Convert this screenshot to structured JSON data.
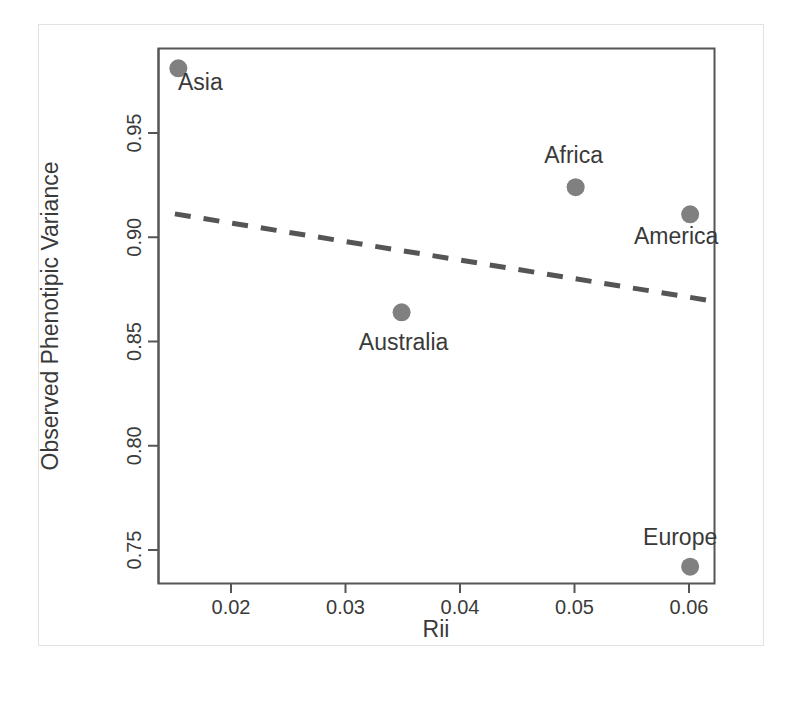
{
  "chart_data": {
    "type": "scatter",
    "title": "",
    "xlabel": "Rii",
    "ylabel": "Observed Phenotipic Variance",
    "xlim": [
      0.0135,
      0.0622
    ],
    "ylim": [
      0.7345,
      0.9825
    ],
    "xticks": [
      0.02,
      0.03,
      0.04,
      0.05,
      0.06
    ],
    "xtick_labels": [
      "0.02",
      "0.03",
      "0.04",
      "0.05",
      "0.06"
    ],
    "yticks": [
      0.75,
      0.8,
      0.85,
      0.9,
      0.95
    ],
    "ytick_labels": [
      "0.75",
      "0.80",
      "0.85",
      "0.90",
      "0.95"
    ],
    "grid": false,
    "legend": "none",
    "point_color": "#808080",
    "point_radius_px": 9,
    "label_color": "#3a3a3a",
    "frame_color": "#555555",
    "points": [
      {
        "label": "Asia",
        "x": 0.0154,
        "y": 0.981,
        "label_dx": 22,
        "label_dy": 22
      },
      {
        "label": "Africa",
        "x": 0.0501,
        "y": 0.924,
        "label_dx": -2,
        "label_dy": -24
      },
      {
        "label": "America",
        "x": 0.0601,
        "y": 0.911,
        "label_dx": -14,
        "label_dy": 30
      },
      {
        "label": "Australia",
        "x": 0.0349,
        "y": 0.864,
        "label_dx": 2,
        "label_dy": 38
      },
      {
        "label": "Europe",
        "x": 0.0601,
        "y": 0.742,
        "label_dx": -10,
        "label_dy": -22
      }
    ],
    "trend_line": {
      "style": "dashed",
      "color": "#555555",
      "width_px": 5,
      "dash_px": "16 13",
      "x0": 0.0151,
      "y0": 0.9112,
      "x1": 0.0622,
      "y1": 0.8693
    }
  }
}
